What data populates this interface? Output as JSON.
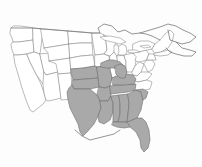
{
  "map": {
    "title": "United States distribution map",
    "type": "choropleth-range-map",
    "background_color": "#fdfdfd",
    "outline_color": "#8d8d8d",
    "highlight_color": "#a9a9a9",
    "highlight_outline_color": "#6e6e6e",
    "legend_present": false,
    "labels_present": false,
    "projection_note": "conterminous United States with southern Canada outline",
    "highlighted_regions": [
      "Kansas",
      "Missouri",
      "Oklahoma",
      "Arkansas",
      "Texas",
      "Louisiana",
      "Mississippi",
      "Alabama",
      "Tennessee",
      "Kentucky",
      "Georgia",
      "Florida",
      "South Carolina (partial)",
      "Michigan Upper Peninsula (partial)",
      "Michigan Lower Peninsula (partial)"
    ],
    "unhighlighted_regions": [
      "Washington",
      "Oregon",
      "California",
      "Idaho",
      "Nevada",
      "Utah",
      "Arizona",
      "Montana",
      "Wyoming",
      "Colorado",
      "New Mexico",
      "North Dakota",
      "South Dakota",
      "Nebraska",
      "Minnesota",
      "Iowa",
      "Wisconsin",
      "Illinois",
      "Indiana",
      "Ohio",
      "West Virginia",
      "Virginia",
      "North Carolina",
      "Pennsylvania",
      "New York",
      "Maine",
      "Vermont",
      "New Hampshire",
      "Massachusetts",
      "Connecticut",
      "Rhode Island",
      "New Jersey",
      "Delaware",
      "Maryland"
    ]
  }
}
